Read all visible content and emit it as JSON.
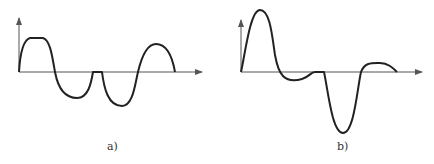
{
  "figure": {
    "panels": [
      {
        "id": "a",
        "label": "a)",
        "description": "Waveform with flattened positive peak, negative lobe, short zero dwell, negative lobe, positive lobe",
        "axis_color": "#555555",
        "curve_color": "#222222"
      },
      {
        "id": "b",
        "label": "b)",
        "description": "Waveform with tall sharp positive peak, shallow negative lobe, zero dwell, deep negative lobe, small positive hump",
        "axis_color": "#555555",
        "curve_color": "#222222"
      }
    ]
  }
}
